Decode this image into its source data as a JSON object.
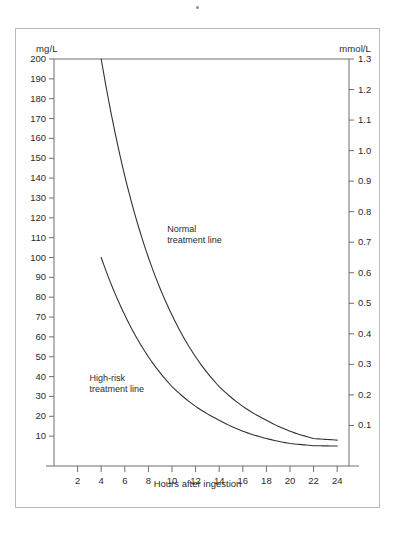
{
  "figure": {
    "left_axis_unit": "mg/L",
    "right_axis_unit": "mmol/L",
    "xaxis_title": "Hours after ingestion",
    "normal_label_line1": "Normal",
    "normal_label_line2": "treatment line",
    "highrisk_label_line1": "High-risk",
    "highrisk_label_line2": "treatment line",
    "line_color": "#333333",
    "axis_color": "#6f6f6f",
    "frame_color": "#b9b9b9",
    "background": "#ffffff"
  },
  "chart_data": {
    "type": "line",
    "title": "",
    "xlabel": "Hours after ingestion",
    "ylabel": "mg/L",
    "ylabel_right": "mmol/L",
    "xlim": [
      0,
      25
    ],
    "ylim": [
      0,
      200
    ],
    "ylim_right": [
      0,
      1.3
    ],
    "grid": false,
    "legend": "inline-annotations",
    "xticks": [
      2,
      4,
      6,
      8,
      10,
      12,
      14,
      16,
      18,
      20,
      22,
      24
    ],
    "xticklabels": [
      "2",
      "4",
      "6",
      "8",
      "10",
      "12",
      "14",
      "16",
      "18",
      "20",
      "22",
      "24"
    ],
    "yticks_left": [
      10,
      20,
      30,
      40,
      50,
      60,
      70,
      80,
      90,
      100,
      110,
      120,
      130,
      140,
      150,
      160,
      170,
      180,
      190,
      200
    ],
    "yticklabels_left": [
      "10",
      "20",
      "30",
      "40",
      "50",
      "60",
      "70",
      "80",
      "90",
      "100",
      "110",
      "120",
      "130",
      "140",
      "150",
      "160",
      "170",
      "180",
      "190",
      "200"
    ],
    "yticks_right": [
      0.1,
      0.2,
      0.3,
      0.4,
      0.5,
      0.6,
      0.7,
      0.8,
      0.9,
      1.0,
      1.1,
      1.2,
      1.3
    ],
    "yticklabels_right": [
      "0.1",
      "0.2",
      "0.3",
      "0.4",
      "0.5",
      "0.6",
      "0.7",
      "0.8",
      "0.9",
      "1.0",
      "1.1",
      "1.2",
      "1.3"
    ],
    "x": [
      4,
      6,
      8,
      10,
      12,
      14,
      16,
      18,
      20,
      22,
      24
    ],
    "series": [
      {
        "name": "Normal treatment line",
        "annotation": "Normal treatment line",
        "values": [
          200,
          141,
          100,
          71,
          50,
          35,
          25,
          18,
          12.5,
          8.8,
          8.0
        ]
      },
      {
        "name": "High-risk treatment line",
        "annotation": "High-risk treatment line",
        "values": [
          100,
          71,
          50,
          35,
          25,
          18,
          12.5,
          8.8,
          6.3,
          5.2,
          5.0
        ]
      }
    ]
  }
}
